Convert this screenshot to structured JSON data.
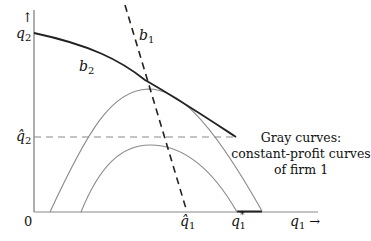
{
  "diagram": {
    "axes": {
      "y_label": "q",
      "y_label_sub": "2",
      "y_arrow": "↑",
      "x_label": "q",
      "x_label_sub": "1",
      "x_arrow": "→",
      "origin": "0"
    },
    "curves": {
      "b1_label": "b",
      "b1_sub": "1",
      "b2_label": "b",
      "b2_sub": "2"
    },
    "ticks": {
      "q2_hat": "q̂",
      "q2_hat_sub": "2",
      "q1_hat": "q̂",
      "q1_hat_sub": "1",
      "q1_star": "q",
      "q1_star_sub": "1",
      "q1_star_sup": "*"
    },
    "caption": {
      "line1": "Gray curves:",
      "line2": "constant-profit curves",
      "line3": "of firm 1"
    },
    "colors": {
      "axis": "#777777",
      "best_response": "#222222",
      "isoprofit": "#8a8a8a",
      "text": "#111111"
    }
  }
}
